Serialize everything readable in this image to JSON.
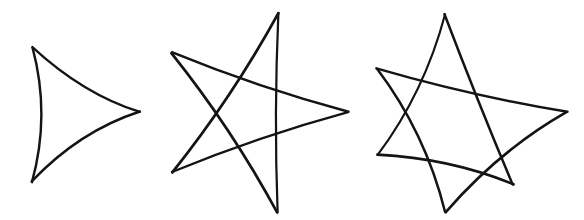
{
  "canvas": {
    "width": 584,
    "height": 220,
    "background_color": "#ffffff",
    "ink_color": "#141414",
    "description": "Three hand-drawn curved star polygons in black ink on a white background"
  },
  "figures": [
    {
      "id": "figure-1",
      "name": "curved-triangle-3-cusp",
      "label": "3-cusped curved star",
      "points": 3,
      "step": 1,
      "self_intersecting": false,
      "center": {
        "x": 76,
        "y": 113
      },
      "stroke_width": 2.5,
      "arc_bulge": 0.46,
      "cusps": [
        {
          "x": 33,
          "y": 47
        },
        {
          "x": 140,
          "y": 112
        },
        {
          "x": 32,
          "y": 182
        }
      ]
    },
    {
      "id": "figure-2",
      "name": "curved-star-5-point",
      "label": "5-pointed curved star",
      "points": 5,
      "step": 2,
      "self_intersecting": true,
      "center": {
        "x": 260,
        "y": 113
      },
      "stroke_width": 2.5,
      "arc_bulge": 0.2,
      "cusps": [
        {
          "x": 278,
          "y": 13
        },
        {
          "x": 348,
          "y": 112
        },
        {
          "x": 277,
          "y": 212
        },
        {
          "x": 172,
          "y": 172
        },
        {
          "x": 172,
          "y": 53
        }
      ]
    },
    {
      "id": "figure-3",
      "name": "curved-star-6-point",
      "label": "6-pointed curved star",
      "points": 6,
      "step": 2,
      "self_intersecting": true,
      "center": {
        "x": 470,
        "y": 113
      },
      "stroke_width": 2.5,
      "arc_bulge": 0.22,
      "cusps": [
        {
          "x": 445,
          "y": 14
        },
        {
          "x": 567,
          "y": 112
        },
        {
          "x": 513,
          "y": 185
        },
        {
          "x": 445,
          "y": 212
        },
        {
          "x": 377,
          "y": 155
        },
        {
          "x": 377,
          "y": 69
        }
      ]
    }
  ]
}
